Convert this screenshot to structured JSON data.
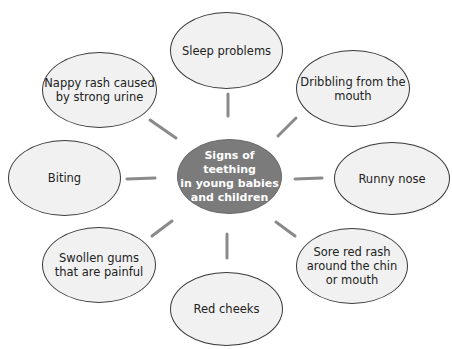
{
  "diagram": {
    "center": {
      "label": "Signs of teething\nin young babies\nand children",
      "fill": "#7b7b7b",
      "text_color": "#ffffff"
    },
    "nodes": [
      {
        "id": "sleep",
        "label": "Sleep problems"
      },
      {
        "id": "dribbling",
        "label": "Dribbling from the\nmouth"
      },
      {
        "id": "runny-nose",
        "label": "Runny nose"
      },
      {
        "id": "sore-rash",
        "label": "Sore red rash\naround the chin\nor mouth"
      },
      {
        "id": "red-cheeks",
        "label": "Red cheeks"
      },
      {
        "id": "swollen-gums",
        "label": "Swollen gums\nthat are painful"
      },
      {
        "id": "biting",
        "label": "Biting"
      },
      {
        "id": "nappy-rash",
        "label": "Nappy rash caused\nby strong urine"
      }
    ],
    "bubble_fill": "#f1f1f1",
    "connector_color": "#8a8a8a"
  }
}
